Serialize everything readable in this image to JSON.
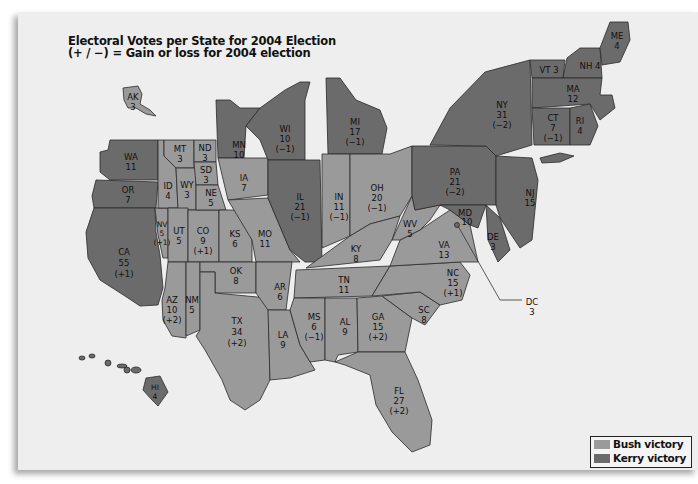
{
  "title": {
    "line1": "Electoral Votes per State for 2004 Election",
    "line2": "(+ / −) = Gain or loss for 2004 election"
  },
  "colors": {
    "bush": "#9a9a9a",
    "kerry": "#6b6b6b",
    "background": "#eeeeee"
  },
  "legend": {
    "items": [
      {
        "label": "Bush victory",
        "color": "#9a9a9a"
      },
      {
        "label": "Kerry victory",
        "color": "#6b6b6b"
      }
    ]
  },
  "states": [
    {
      "abbr": "AK",
      "votes": "3",
      "change": "",
      "winner": "Bush"
    },
    {
      "abbr": "WA",
      "votes": "11",
      "change": "",
      "winner": "Kerry"
    },
    {
      "abbr": "OR",
      "votes": "7",
      "change": "",
      "winner": "Kerry"
    },
    {
      "abbr": "CA",
      "votes": "55",
      "change": "(+1)",
      "winner": "Kerry"
    },
    {
      "abbr": "NV",
      "votes": "5",
      "change": "(+1)",
      "winner": "Bush"
    },
    {
      "abbr": "ID",
      "votes": "4",
      "change": "",
      "winner": "Bush"
    },
    {
      "abbr": "MT",
      "votes": "3",
      "change": "",
      "winner": "Bush"
    },
    {
      "abbr": "WY",
      "votes": "3",
      "change": "",
      "winner": "Bush"
    },
    {
      "abbr": "UT",
      "votes": "5",
      "change": "",
      "winner": "Bush"
    },
    {
      "abbr": "AZ",
      "votes": "10",
      "change": "(+2)",
      "winner": "Bush"
    },
    {
      "abbr": "NM",
      "votes": "5",
      "change": "",
      "winner": "Bush"
    },
    {
      "abbr": "CO",
      "votes": "9",
      "change": "(+1)",
      "winner": "Bush"
    },
    {
      "abbr": "ND",
      "votes": "3",
      "change": "",
      "winner": "Bush"
    },
    {
      "abbr": "SD",
      "votes": "3",
      "change": "",
      "winner": "Bush"
    },
    {
      "abbr": "NE",
      "votes": "5",
      "change": "",
      "winner": "Bush"
    },
    {
      "abbr": "KS",
      "votes": "6",
      "change": "",
      "winner": "Bush"
    },
    {
      "abbr": "OK",
      "votes": "8",
      "change": "",
      "winner": "Bush"
    },
    {
      "abbr": "TX",
      "votes": "34",
      "change": "(+2)",
      "winner": "Bush"
    },
    {
      "abbr": "MN",
      "votes": "10",
      "change": "",
      "winner": "Kerry"
    },
    {
      "abbr": "IA",
      "votes": "7",
      "change": "",
      "winner": "Bush"
    },
    {
      "abbr": "MO",
      "votes": "11",
      "change": "",
      "winner": "Bush"
    },
    {
      "abbr": "AR",
      "votes": "6",
      "change": "",
      "winner": "Bush"
    },
    {
      "abbr": "LA",
      "votes": "9",
      "change": "",
      "winner": "Bush"
    },
    {
      "abbr": "WI",
      "votes": "10",
      "change": "(−1)",
      "winner": "Kerry"
    },
    {
      "abbr": "IL",
      "votes": "21",
      "change": "(−1)",
      "winner": "Kerry"
    },
    {
      "abbr": "MI",
      "votes": "17",
      "change": "(−1)",
      "winner": "Kerry"
    },
    {
      "abbr": "IN",
      "votes": "11",
      "change": "(−1)",
      "winner": "Bush"
    },
    {
      "abbr": "OH",
      "votes": "20",
      "change": "(−1)",
      "winner": "Bush"
    },
    {
      "abbr": "KY",
      "votes": "8",
      "change": "",
      "winner": "Bush"
    },
    {
      "abbr": "TN",
      "votes": "11",
      "change": "",
      "winner": "Bush"
    },
    {
      "abbr": "MS",
      "votes": "6",
      "change": "(−1)",
      "winner": "Bush"
    },
    {
      "abbr": "AL",
      "votes": "9",
      "change": "",
      "winner": "Bush"
    },
    {
      "abbr": "GA",
      "votes": "15",
      "change": "(+2)",
      "winner": "Bush"
    },
    {
      "abbr": "FL",
      "votes": "27",
      "change": "(+2)",
      "winner": "Bush"
    },
    {
      "abbr": "SC",
      "votes": "8",
      "change": "",
      "winner": "Bush"
    },
    {
      "abbr": "NC",
      "votes": "15",
      "change": "(+1)",
      "winner": "Bush"
    },
    {
      "abbr": "VA",
      "votes": "13",
      "change": "",
      "winner": "Bush"
    },
    {
      "abbr": "WV",
      "votes": "5",
      "change": "",
      "winner": "Bush"
    },
    {
      "abbr": "PA",
      "votes": "21",
      "change": "(−2)",
      "winner": "Kerry"
    },
    {
      "abbr": "NY",
      "votes": "31",
      "change": "(−2)",
      "winner": "Kerry"
    },
    {
      "abbr": "NJ",
      "votes": "15",
      "change": "",
      "winner": "Kerry"
    },
    {
      "abbr": "DE",
      "votes": "3",
      "change": "",
      "winner": "Kerry"
    },
    {
      "abbr": "MD",
      "votes": "10",
      "change": "",
      "winner": "Kerry"
    },
    {
      "abbr": "DC",
      "votes": "3",
      "change": "",
      "winner": "Kerry"
    },
    {
      "abbr": "VT",
      "votes": "3",
      "change": "",
      "winner": "Kerry"
    },
    {
      "abbr": "NH",
      "votes": "4",
      "change": "",
      "winner": "Kerry"
    },
    {
      "abbr": "ME",
      "votes": "4",
      "change": "",
      "winner": "Kerry"
    },
    {
      "abbr": "MA",
      "votes": "12",
      "change": "",
      "winner": "Kerry"
    },
    {
      "abbr": "CT",
      "votes": "7",
      "change": "(−1)",
      "winner": "Kerry"
    },
    {
      "abbr": "RI",
      "votes": "4",
      "change": "",
      "winner": "Kerry"
    },
    {
      "abbr": "HI",
      "votes": "4",
      "change": "",
      "winner": "Kerry"
    }
  ]
}
